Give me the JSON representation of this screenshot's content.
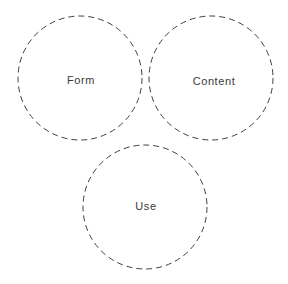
{
  "diagram": {
    "type": "venn-like-triad",
    "background_color": "#ffffff",
    "stroke_color": "#3f3f3f",
    "stroke_width": 1,
    "dash_pattern": "6 4",
    "text_color": "#3a3a3a",
    "canvas": {
      "width": 288,
      "height": 284
    },
    "circles": [
      {
        "id": "form",
        "label": "Form",
        "cx": 80,
        "cy": 78,
        "r": 62,
        "label_x": 81,
        "label_y": 80
      },
      {
        "id": "content",
        "label": "Content",
        "cx": 211,
        "cy": 78,
        "r": 62,
        "label_x": 214,
        "label_y": 81
      },
      {
        "id": "use",
        "label": "Use",
        "cx": 145,
        "cy": 207,
        "r": 62,
        "label_x": 146,
        "label_y": 206
      }
    ]
  }
}
